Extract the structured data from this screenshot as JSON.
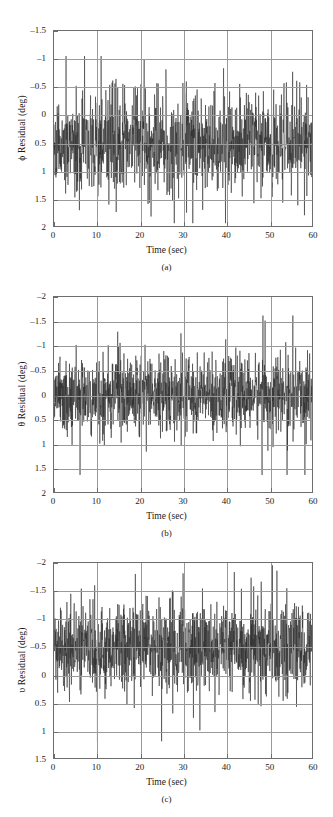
{
  "figure": {
    "panels": [
      {
        "id": "a",
        "caption": "(a)",
        "ylabel": "ϕ Residual (deg)",
        "xlabel": "Time (sec)",
        "yticks": [
          "2",
          "1.5",
          "1",
          "0.5",
          "0",
          "–0.5",
          "–1",
          "–1.5"
        ],
        "xticks": [
          "0",
          "10",
          "20",
          "30",
          "40",
          "50",
          "60"
        ]
      },
      {
        "id": "b",
        "caption": "(b)",
        "ylabel": "θ Residual (deg)",
        "xlabel": "Time (sec)",
        "yticks": [
          "2",
          "1.5",
          "1",
          "0.5",
          "0",
          "–0.5",
          "–1",
          "–1.5",
          "–2"
        ],
        "xticks": [
          "0",
          "10",
          "20",
          "30",
          "40",
          "50",
          "60"
        ]
      },
      {
        "id": "c",
        "caption": "(c)",
        "ylabel": "υ Residual (deg)",
        "xlabel": "Time (sec)",
        "yticks": [
          "1.5",
          "1",
          "0.5",
          "0",
          "–0.5",
          "–1",
          "–1.5",
          "–2"
        ],
        "xticks": [
          "0",
          "10",
          "20",
          "30",
          "40",
          "50",
          "60"
        ]
      }
    ]
  },
  "chart_data": [
    {
      "type": "line",
      "panel": "a",
      "title": "",
      "xlabel": "Time (sec)",
      "ylabel": "ϕ Residual (deg)",
      "xlim": [
        0,
        60
      ],
      "ylim": [
        -1.5,
        2
      ],
      "xticks": [
        0,
        10,
        20,
        30,
        40,
        50,
        60
      ],
      "yticks": [
        -1.5,
        -1,
        -0.5,
        0,
        0.5,
        1,
        1.5,
        2
      ],
      "grid": true,
      "legend": null,
      "series": [
        {
          "name": "phi residual",
          "noise": {
            "distribution": "zero-mean random residual",
            "n_points": 1200,
            "mean": 0.0,
            "std": 0.42,
            "min": -1.45,
            "max": 1.55,
            "seed": 11
          }
        }
      ]
    },
    {
      "type": "line",
      "panel": "b",
      "title": "",
      "xlabel": "Time (sec)",
      "ylabel": "θ Residual (deg)",
      "xlim": [
        0,
        60
      ],
      "ylim": [
        -2,
        2
      ],
      "xticks": [
        0,
        10,
        20,
        30,
        40,
        50,
        60
      ],
      "yticks": [
        -2,
        -1.5,
        -1,
        -0.5,
        0,
        0.5,
        1,
        1.5,
        2
      ],
      "grid": true,
      "legend": null,
      "series": [
        {
          "name": "theta residual",
          "noise": {
            "distribution": "zero-mean random residual",
            "n_points": 1200,
            "mean": 0.0,
            "std": 0.38,
            "min": -1.65,
            "max": 1.62,
            "seed": 27
          }
        }
      ]
    },
    {
      "type": "line",
      "panel": "c",
      "title": "",
      "xlabel": "Time (sec)",
      "ylabel": "υ Residual (deg)",
      "xlim": [
        0,
        60
      ],
      "ylim": [
        -2,
        1.5
      ],
      "xticks": [
        0,
        10,
        20,
        30,
        40,
        50,
        60
      ],
      "yticks": [
        -2,
        -1.5,
        -1,
        -0.5,
        0,
        0.5,
        1,
        1.5
      ],
      "grid": true,
      "legend": null,
      "series": [
        {
          "name": "upsilon residual",
          "noise": {
            "distribution": "zero-mean random residual",
            "n_points": 1200,
            "mean": 0.0,
            "std": 0.4,
            "min": -1.72,
            "max": 1.46,
            "seed": 43
          }
        }
      ]
    }
  ]
}
